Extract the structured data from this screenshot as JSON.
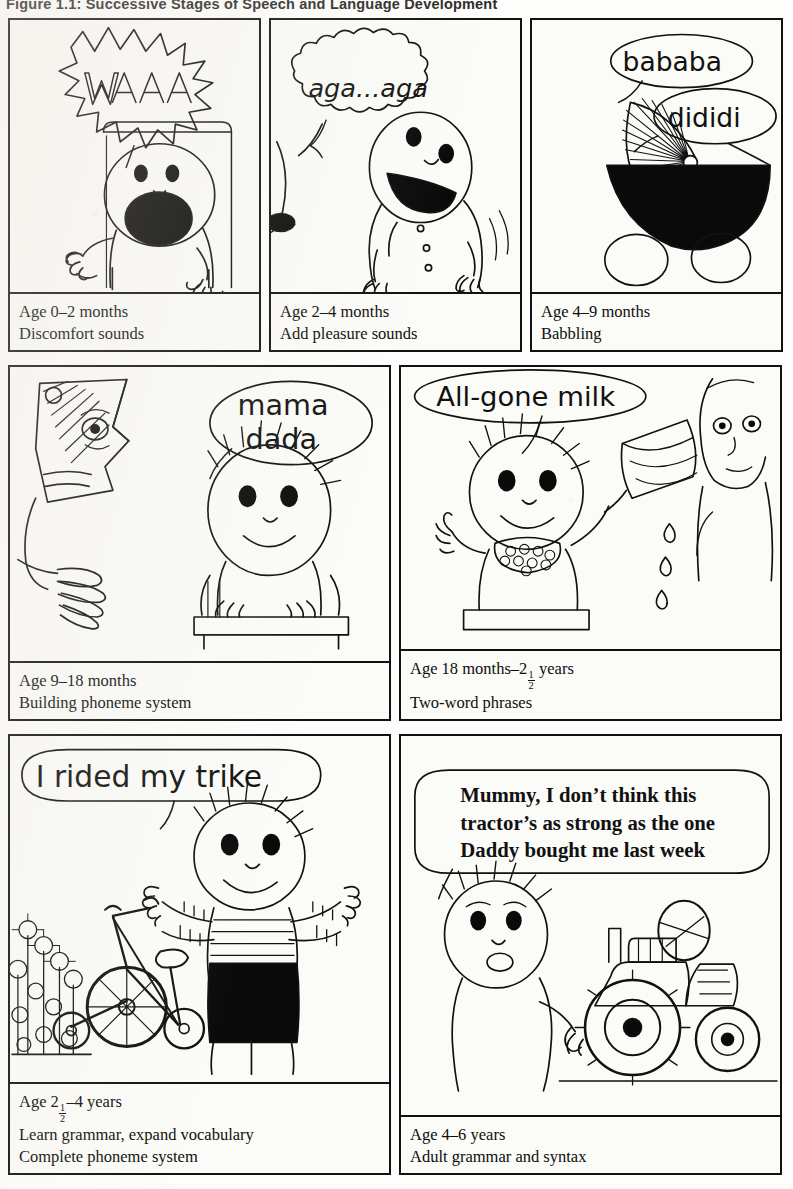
{
  "figure": {
    "title": "Figure 1.1: Successive Stages of Speech and Language Development"
  },
  "panels": [
    {
      "id": "panel-0-2-months",
      "speech": [
        "WAAA"
      ],
      "bubble_style": "starburst",
      "scene": "crying-baby-in-cot",
      "caption_lines": [
        "Age 0–2 months",
        "Discomfort sounds"
      ],
      "age_label": "Age 0–2 months",
      "stage_label": "Discomfort sounds"
    },
    {
      "id": "panel-2-4-months",
      "speech": [
        "aga...aga"
      ],
      "bubble_style": "cloud",
      "scene": "smiling-baby-held-by-adult",
      "caption_lines": [
        "Age 2–4 months",
        "Add pleasure sounds"
      ],
      "age_label": "Age 2–4 months",
      "stage_label": "Add pleasure sounds"
    },
    {
      "id": "panel-4-9-months",
      "speech": [
        "bababa",
        "dididi"
      ],
      "bubble_style": "oval",
      "scene": "baby-in-pram",
      "caption_lines": [
        "Age 4–9 months",
        "Babbling"
      ],
      "age_label": "Age 4–9 months",
      "stage_label": "Babbling"
    },
    {
      "id": "panel-9-18-months",
      "speech": [
        "mama",
        "dada"
      ],
      "bubble_style": "oval",
      "scene": "toddler-in-highchair-with-adult-face",
      "caption_lines": [
        "Age 9–18 months",
        "Building phoneme system"
      ],
      "age_label": "Age 9–18 months",
      "stage_label": "Building phoneme system"
    },
    {
      "id": "panel-18-months-2-5-years",
      "speech": [
        "All-gone milk"
      ],
      "bubble_style": "oval",
      "scene": "child-holding-up-cup-spilling-milk",
      "caption_age_prefix": "Age 18 months–2",
      "caption_age_numerator": "1",
      "caption_age_denominator": "2",
      "caption_age_suffix": " years",
      "caption_lines": [
        "Age 18 months–2½ years",
        "Two-word phrases"
      ],
      "stage_label": "Two-word phrases"
    },
    {
      "id": "panel-2-5-4-years",
      "speech": [
        "I rided my trike"
      ],
      "bubble_style": "oval",
      "scene": "child-with-tricycle-and-flowers",
      "caption_age_prefix": "Age 2",
      "caption_age_numerator": "1",
      "caption_age_denominator": "2",
      "caption_age_suffix": "–4 years",
      "caption_lines": [
        "Age 2½–4 years",
        "Learn grammar, expand vocabulary",
        "Complete phoneme system"
      ],
      "stage_label": "Learn grammar, expand vocabulary",
      "stage_label_2": "Complete phoneme system"
    },
    {
      "id": "panel-4-6-years",
      "speech": [
        "Mummy, I don’t think this",
        "tractor’s as strong as the one",
        "Daddy bought me last week"
      ],
      "bubble_style": "rounded-rect",
      "scene": "child-with-toy-tractor",
      "caption_lines": [
        "Age 4–6 years",
        "Adult grammar and syntax"
      ],
      "age_label": "Age 4–6 years",
      "stage_label": "Adult grammar and syntax"
    }
  ],
  "colors": {
    "ink": "#111111",
    "paper": "#fbfbf8",
    "fill_black": "#0a0a0a"
  }
}
